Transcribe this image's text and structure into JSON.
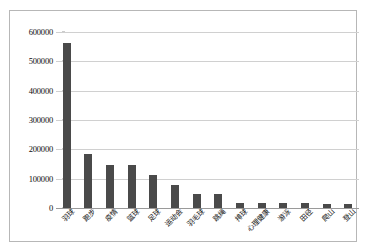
{
  "chart_data": {
    "type": "bar",
    "title": "",
    "subtitle": "",
    "xlabel": "",
    "ylabel": "",
    "legend": [],
    "legend_position": "none",
    "grid": true,
    "orientation": "vertical",
    "bar_color": "#4a4a4a",
    "gridline_color": "#d0d0d0",
    "axis_color": "#9a9a9a",
    "border_color": "#b7b7b7",
    "ylim": [
      0,
      600000
    ],
    "ytick_values": [
      0,
      100000,
      200000,
      300000,
      400000,
      500000,
      600000
    ],
    "ytick_labels": [
      "0",
      "100000",
      "200000",
      "300000",
      "400000",
      "500000",
      "600000"
    ],
    "categories": [
      "羽球",
      "跑步",
      "疫情",
      "篮球",
      "足球",
      "运动会",
      "羽毛球",
      "跳绳",
      "排球",
      "心理健康",
      "游泳",
      "田径",
      "爬山",
      "登山"
    ],
    "values": [
      563000,
      183000,
      147000,
      146000,
      112000,
      79000,
      49000,
      47000,
      18000,
      17000,
      17000,
      17000,
      15000,
      15000
    ]
  }
}
